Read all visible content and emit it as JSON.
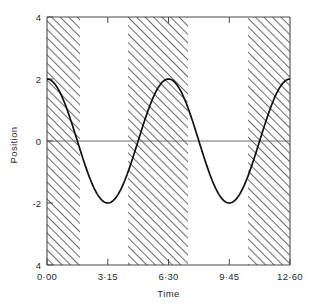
{
  "chart_data": {
    "type": "line",
    "title": "",
    "xlabel": "Time",
    "ylabel": "Position",
    "xlim": [
      0,
      12.6
    ],
    "ylim": [
      -4,
      4
    ],
    "grid": false,
    "legend": null,
    "x_tick_labels": [
      "0·00",
      "3·15",
      "6·30",
      "9·45",
      "12·60"
    ],
    "x_tick_values": [
      0,
      3.15,
      6.3,
      9.45,
      12.6
    ],
    "y_tick_labels": [
      "4",
      "2",
      "0",
      "-2",
      "4"
    ],
    "y_tick_values": [
      4,
      2,
      0,
      -2,
      -4
    ],
    "series": [
      {
        "name": "Position",
        "description": "cosine wave, amplitude 2, period 6.30 time units, starting at +2",
        "amplitude": 2,
        "period": 6.3,
        "phase": 0,
        "offset": 0,
        "x": [
          0.0,
          0.32,
          0.63,
          0.95,
          1.26,
          1.58,
          1.89,
          2.21,
          2.52,
          2.84,
          3.15,
          3.47,
          3.78,
          4.1,
          4.41,
          4.73,
          5.04,
          5.36,
          5.67,
          5.99,
          6.3,
          6.62,
          6.93,
          7.25,
          7.56,
          7.88,
          8.19,
          8.51,
          8.82,
          9.14,
          9.45,
          9.77,
          10.08,
          10.4,
          10.71,
          11.03,
          11.34,
          11.66,
          11.97,
          12.29,
          12.6
        ],
        "values": [
          2.0,
          1.9,
          1.62,
          1.18,
          0.62,
          0.0,
          -0.62,
          -1.18,
          -1.62,
          -1.9,
          -2.0,
          -1.9,
          -1.62,
          -1.18,
          -0.62,
          0.0,
          0.62,
          1.18,
          1.62,
          1.9,
          2.0,
          1.9,
          1.62,
          1.18,
          0.62,
          0.0,
          -0.62,
          -1.18,
          -1.62,
          -1.9,
          -2.0,
          -1.9,
          -1.62,
          -1.18,
          -0.62,
          0.0,
          0.62,
          1.18,
          1.62,
          1.9,
          2.0
        ]
      }
    ],
    "shaded_bands": [
      {
        "x_start": 0.0,
        "x_end": 1.71,
        "pattern": "diagonal-hatch"
      },
      {
        "x_start": 4.2,
        "x_end": 7.31,
        "pattern": "diagonal-hatch"
      },
      {
        "x_start": 10.42,
        "x_end": 12.6,
        "pattern": "diagonal-hatch"
      }
    ],
    "annotations": []
  },
  "figure": {
    "y_axis_title": "Position",
    "x_axis_title": "Time"
  },
  "colors": {
    "curve": "#111111",
    "axis": "#4a4a4a",
    "zero_line": "#6b6b6b",
    "hatch": "#3a3a3a",
    "background": "#ffffff"
  }
}
